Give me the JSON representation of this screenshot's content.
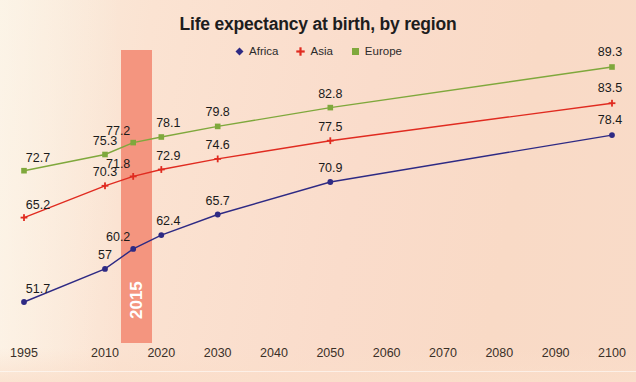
{
  "chart": {
    "title": "Life expectancy at birth, by region",
    "highlight": {
      "label": "2015",
      "color": "#f4957f"
    },
    "legend": [
      {
        "label": "Africa",
        "color": "#2e2a84",
        "marker": "diamond-marker-icon"
      },
      {
        "label": "Asia",
        "color": "#e02b20",
        "marker": "cross-marker-icon"
      },
      {
        "label": "Europe",
        "color": "#7fa83c",
        "marker": "square-marker-icon"
      }
    ]
  },
  "chart_data": {
    "type": "line",
    "title": "Life expectancy at birth, by region",
    "xlabel": "",
    "ylabel": "",
    "x": [
      1995,
      2010,
      2015,
      2020,
      2030,
      2050,
      2100
    ],
    "categories": [
      "1995",
      "2010",
      "2015",
      "2020",
      "2030",
      "2050",
      "2100"
    ],
    "xticks": [
      "1995",
      "2010",
      "2020",
      "2030",
      "2040",
      "2050",
      "2060",
      "2070",
      "2080",
      "2090",
      "2100"
    ],
    "xlim": [
      1995,
      2100
    ],
    "ylim": [
      50,
      91
    ],
    "grid": false,
    "legend_position": "top-center",
    "annotations": [
      "2015 highlight band"
    ],
    "series": [
      {
        "name": "Africa",
        "color": "#2e2a84",
        "marker": "diamond",
        "values": [
          51.7,
          57,
          60.2,
          62.4,
          65.7,
          70.9,
          78.4
        ],
        "labels": [
          "51.7",
          "57",
          "60.2",
          "62.4",
          "65.7",
          "70.9",
          "78.4"
        ]
      },
      {
        "name": "Asia",
        "color": "#e02b20",
        "marker": "cross",
        "values": [
          65.2,
          70.3,
          71.8,
          72.9,
          74.6,
          77.5,
          83.5
        ],
        "labels": [
          "65.2",
          "70.3",
          "71.8",
          "72.9",
          "74.6",
          "77.5",
          "83.5"
        ]
      },
      {
        "name": "Europe",
        "color": "#7fa83c",
        "marker": "square",
        "values": [
          72.7,
          75.3,
          77.2,
          78.1,
          79.8,
          82.8,
          89.3
        ],
        "labels": [
          "72.7",
          "75.3",
          "77.2",
          "78.1",
          "79.8",
          "82.8",
          "89.3"
        ]
      }
    ]
  }
}
